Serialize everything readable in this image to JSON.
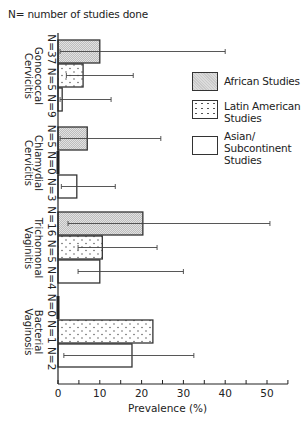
{
  "note": "N= number of studies done",
  "legend": [
    {
      "key": "african",
      "label_lines": [
        "African Studies"
      ]
    },
    {
      "key": "latin",
      "label_lines": [
        "Latin American",
        "Studies"
      ]
    },
    {
      "key": "asian",
      "label_lines": [
        "Asian/",
        "Subcontinent",
        "Studies"
      ]
    }
  ],
  "chart_data": {
    "type": "bar",
    "orientation": "horizontal",
    "title": "",
    "note": "N= number of studies done",
    "xlabel": "Prevalence (%)",
    "ylabel": "",
    "xlim": [
      0,
      55
    ],
    "xticks": [
      0,
      10,
      20,
      30,
      40,
      50
    ],
    "minor_ticks": [
      5,
      15,
      25,
      35,
      45,
      55
    ],
    "grid": false,
    "legend_position": "right",
    "categories": [
      "Gonococcal Cervicitis",
      "Chlamydial Cervicitis",
      "Trichomonal Vaginitis",
      "Bacterial Vaginosis"
    ],
    "category_label_lines": [
      [
        "Gonococcal",
        "Cervicitis"
      ],
      [
        "Chlamydial",
        "Cervicitis"
      ],
      [
        "Trichomonal",
        "Vaginitis"
      ],
      [
        "Bacterial",
        "Vaginosis"
      ]
    ],
    "series": [
      {
        "name": "African Studies",
        "key": "african",
        "n": [
          37,
          5,
          16,
          0
        ],
        "values": [
          10,
          7,
          20.3,
          null
        ],
        "error_low": [
          0.5,
          0.5,
          2.4,
          null
        ],
        "error_high": [
          40,
          24.6,
          50.7,
          null
        ]
      },
      {
        "name": "Latin American Studies",
        "key": "latin",
        "n": [
          5,
          0,
          5,
          1
        ],
        "values": [
          6,
          null,
          10.6,
          22.7
        ],
        "error_low": [
          2,
          null,
          4.8,
          null
        ],
        "error_high": [
          18,
          null,
          23.7,
          null
        ]
      },
      {
        "name": "Asian/Subcontinent Studies",
        "key": "asian",
        "n": [
          9,
          3,
          4,
          2
        ],
        "values": [
          1,
          4.5,
          10,
          17.7
        ],
        "error_low": [
          0.5,
          0.8,
          4.8,
          1.4
        ],
        "error_high": [
          12.7,
          13.7,
          30,
          32.5
        ]
      }
    ]
  }
}
